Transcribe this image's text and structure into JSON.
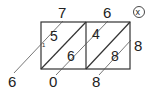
{
  "diagram": {
    "type": "lattice-multiplication",
    "colors": {
      "line": "#333333",
      "text": "#222222",
      "guide": "#555555"
    },
    "multiplicand": {
      "digits": [
        "7",
        "6"
      ]
    },
    "multiplier": {
      "digits": [
        "8"
      ]
    },
    "operator_symbol": "ⓧ",
    "cells": [
      {
        "tens": "5",
        "ones": "6"
      },
      {
        "tens": "4",
        "ones": "8"
      }
    ],
    "carry": "1",
    "result_digits": [
      "6",
      "0",
      "8"
    ]
  }
}
